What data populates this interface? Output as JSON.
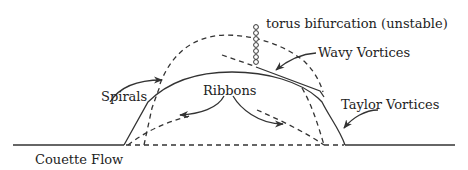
{
  "diagram": {
    "type": "bifurcation-diagram",
    "labels": {
      "torus": "torus bifurcation (unstable)",
      "wavy": "Wavy Vortices",
      "spirals": "Spirals",
      "ribbons": "Ribbons",
      "taylor": "Taylor Vortices",
      "couette": "Couette Flow"
    },
    "colors": {
      "stroke": "#333333",
      "text": "#222222",
      "background": "#ffffff"
    },
    "legend": {
      "solid": "stable branch",
      "dashed": "unstable branch"
    }
  }
}
